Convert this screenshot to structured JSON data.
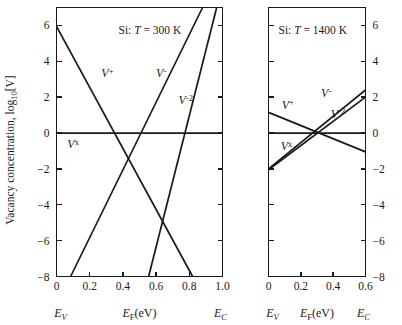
{
  "figure": {
    "y_axis_title": "Vacancy concentration, log10[V]",
    "y_axis_title_parts": {
      "main": "Vacancy concentration, log",
      "sub": "10",
      "tail": "[V]"
    }
  },
  "chart_data": [
    {
      "type": "line",
      "panel": "left",
      "title": "Si:  T = 300 K",
      "title_parts": {
        "material": "Si:",
        "tvar": "T",
        "eq": "= 300 K"
      },
      "xlabel": "E_F(eV)",
      "xlabel_parts": {
        "e": "E",
        "sub": "F",
        "unit": "(eV)"
      },
      "ylabel": "Vacancy concentration, log10[V]",
      "xlim": [
        0.0,
        1.0
      ],
      "ylim": [
        -8,
        7.0
      ],
      "xticks": [
        0.0,
        0.2,
        0.4,
        0.6,
        0.8,
        1.0
      ],
      "xticklabels": [
        "0",
        "0.2",
        "0.4",
        "0.6",
        "0.8",
        "1.0"
      ],
      "yticks": [
        -8,
        -6,
        -4,
        -2,
        0,
        2,
        4,
        6
      ],
      "yticklabels": [
        "-8",
        "-6",
        "-4",
        "-2",
        "0",
        "2",
        "4",
        "6"
      ],
      "grid": false,
      "legend": "inline-curve-labels",
      "band_edge_left": "E_V",
      "band_edge_left_parts": {
        "e": "E",
        "sub": "V"
      },
      "band_edge_right": "E_C",
      "band_edge_right_parts": {
        "e": "E",
        "sub": "C"
      },
      "series": [
        {
          "name": "V+",
          "name_parts": {
            "base": "V",
            "sup": "+"
          },
          "label_x": 0.27,
          "label_y": 3.1,
          "points": [
            [
              0.0,
              5.95
            ],
            [
              0.82,
              -8.0
            ]
          ]
        },
        {
          "name": "Vx",
          "name_parts": {
            "base": "V",
            "sup": "x"
          },
          "label_x": 0.065,
          "label_y": -0.85,
          "points": [
            [
              0.0,
              0.0
            ],
            [
              1.0,
              0.0
            ]
          ]
        },
        {
          "name": "V-",
          "name_parts": {
            "base": "V",
            "sup": "-"
          },
          "label_x": 0.6,
          "label_y": 3.1,
          "points": [
            [
              0.085,
              -8.0
            ],
            [
              0.88,
              7.0
            ]
          ]
        },
        {
          "name": "V-2",
          "name_parts": {
            "base": "V",
            "sup": "-2"
          },
          "label_x": 0.735,
          "label_y": 1.6,
          "points": [
            [
              0.555,
              -8.0
            ],
            [
              0.965,
              7.0
            ]
          ]
        }
      ]
    },
    {
      "type": "line",
      "panel": "right",
      "title": "Si:  T = 1400 K",
      "title_parts": {
        "material": "Si:",
        "tvar": "T",
        "eq": "= 1400 K"
      },
      "xlabel": "E_F(eV)",
      "xlabel_parts": {
        "e": "E",
        "sub": "F",
        "unit": "(eV)"
      },
      "xlim": [
        0.0,
        0.6
      ],
      "ylim": [
        -8,
        7.0
      ],
      "xticks": [
        0.0,
        0.2,
        0.4,
        0.6
      ],
      "xticklabels": [
        "0",
        "0.2",
        "0.4",
        "0.6"
      ],
      "yticks": [
        -8,
        -6,
        -4,
        -2,
        0,
        2,
        4,
        6
      ],
      "yticklabels": [
        "-8",
        "-6",
        "-4",
        "-2",
        "0",
        "2",
        "4",
        "6"
      ],
      "grid": false,
      "legend": "inline-curve-labels",
      "band_edge_left": "E_V",
      "band_edge_left_parts": {
        "e": "E",
        "sub": "V"
      },
      "band_edge_right": "E_C",
      "band_edge_right_parts": {
        "e": "E",
        "sub": "C"
      },
      "series": [
        {
          "name": "V+",
          "name_parts": {
            "base": "V",
            "sup": "+"
          },
          "label_x": 0.082,
          "label_y": 1.35,
          "points": [
            [
              0.0,
              1.15
            ],
            [
              0.6,
              -1.05
            ]
          ]
        },
        {
          "name": "Vx",
          "name_parts": {
            "base": "V",
            "sup": "x"
          },
          "label_x": 0.075,
          "label_y": -0.95,
          "points": [
            [
              0.0,
              0.0
            ],
            [
              0.6,
              0.0
            ]
          ]
        },
        {
          "name": "V-",
          "name_parts": {
            "base": "V",
            "sup": "-"
          },
          "label_x": 0.325,
          "label_y": 2.0,
          "points": [
            [
              0.0,
              -2.0
            ],
            [
              0.6,
              2.4
            ]
          ]
        },
        {
          "name": "V-2",
          "name_parts": {
            "base": "V",
            "sup": "-2"
          },
          "label_x": 0.385,
          "label_y": 0.85,
          "points": [
            [
              0.0,
              -2.05
            ],
            [
              0.6,
              2.0
            ]
          ]
        }
      ]
    }
  ]
}
